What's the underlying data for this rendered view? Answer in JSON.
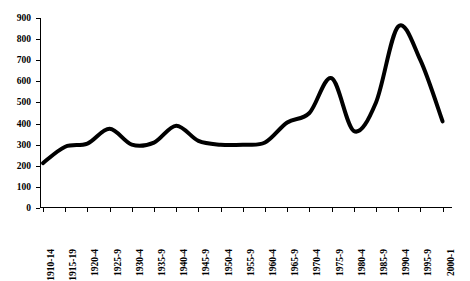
{
  "chart_data": {
    "type": "line",
    "title": "",
    "subtitle": "",
    "xlabel": "",
    "ylabel": "",
    "categories": [
      "1910-14",
      "1915-19",
      "1920-4",
      "1925-9",
      "1930-4",
      "1935-9",
      "1940-4",
      "1945-9",
      "1950-4",
      "1955-9",
      "1960-4",
      "1965-9",
      "1970-4",
      "1975-9",
      "1980-4",
      "1985-9",
      "1990-4",
      "1995-9",
      "2000-1"
    ],
    "values": [
      213,
      290,
      305,
      375,
      300,
      310,
      390,
      318,
      300,
      300,
      310,
      405,
      450,
      615,
      365,
      500,
      860,
      700,
      410
    ],
    "ylim": [
      0,
      900
    ],
    "yticks": [
      0,
      100,
      200,
      300,
      400,
      500,
      600,
      700,
      800,
      900
    ],
    "ytick_labels": [
      "0",
      "100",
      "200",
      "300",
      "400",
      "500",
      "600",
      "700",
      "800",
      "900"
    ],
    "grid": false,
    "legend": null,
    "legend_position": "none",
    "series": [
      {
        "name": "series-1",
        "values": [
          213,
          290,
          305,
          375,
          300,
          310,
          390,
          318,
          300,
          300,
          310,
          405,
          450,
          615,
          365,
          500,
          860,
          700,
          410
        ]
      }
    ],
    "line_color": "#000000",
    "line_width": 4,
    "smoothing": "spline",
    "annotations": []
  },
  "axes": {
    "y_axis_name": "y-axis",
    "x_axis_name": "x-axis"
  }
}
